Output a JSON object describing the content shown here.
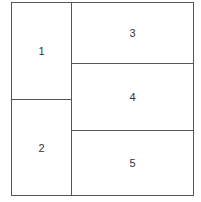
{
  "diagram": {
    "type": "layout-grid",
    "cells": [
      {
        "id": "1",
        "label": "1"
      },
      {
        "id": "2",
        "label": "2"
      },
      {
        "id": "3",
        "label": "3"
      },
      {
        "id": "4",
        "label": "4"
      },
      {
        "id": "5",
        "label": "5"
      }
    ],
    "line_color": "#555555",
    "text_color": "#333333"
  }
}
